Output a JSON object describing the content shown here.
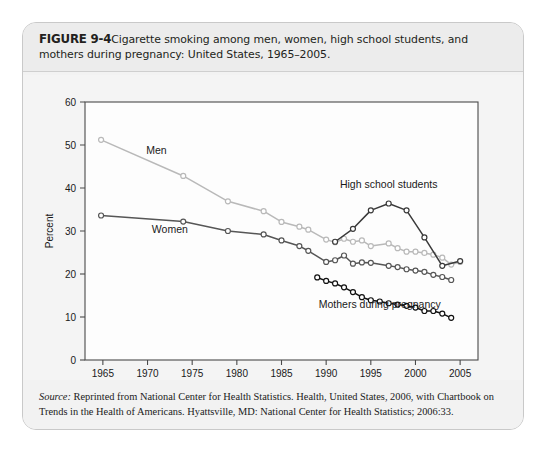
{
  "figure": {
    "number_label": "FIGURE 9-4",
    "caption": "Cigarette smoking among men, women, high school students, and mothers during pregnancy: United States, 1965–2005."
  },
  "source": {
    "label": "Source:",
    "text": " Reprinted from National Center for Health Statistics. Health, United States, 2006, with Chartbook on Trends in the Health of Americans. Hyattsville, MD: National Center for Health Statistics; 2006:33."
  },
  "chart_data": {
    "type": "line",
    "title": "",
    "xlabel": "Year",
    "ylabel": "Percent",
    "xlim": [
      1963,
      2007
    ],
    "ylim": [
      0,
      60
    ],
    "xticks": [
      1965,
      1970,
      1975,
      1980,
      1985,
      1990,
      1995,
      2000,
      2005
    ],
    "yticks": [
      0,
      10,
      20,
      30,
      40,
      50,
      60
    ],
    "grid": false,
    "legend": "inline-annotations",
    "series": [
      {
        "name": "Men",
        "color": "#b9b9b9",
        "marker": "open-circle",
        "label_x": 1971.0,
        "label_y": 48.0,
        "points": [
          [
            1964.8,
            51.2
          ],
          [
            1974.0,
            42.8
          ],
          [
            1979.0,
            36.9
          ],
          [
            1983.0,
            34.6
          ],
          [
            1985.0,
            32.1
          ],
          [
            1987.0,
            31.0
          ],
          [
            1988.0,
            30.3
          ],
          [
            1990.0,
            28.0
          ],
          [
            1991.0,
            27.4
          ],
          [
            1992.0,
            28.2
          ],
          [
            1993.0,
            27.5
          ],
          [
            1994.0,
            27.8
          ],
          [
            1995.0,
            26.5
          ],
          [
            1997.0,
            27.1
          ],
          [
            1998.0,
            26.0
          ],
          [
            1999.0,
            25.2
          ],
          [
            2000.0,
            25.2
          ],
          [
            2001.0,
            24.9
          ],
          [
            2002.0,
            24.5
          ],
          [
            2003.0,
            23.8
          ],
          [
            2004.0,
            22.2
          ],
          [
            2005.0,
            22.8
          ]
        ]
      },
      {
        "name": "Women",
        "color": "#565656",
        "marker": "open-circle",
        "label_x": 1972.5,
        "label_y": 29.6,
        "points": [
          [
            1964.8,
            33.6
          ],
          [
            1974.0,
            32.2
          ],
          [
            1979.0,
            30.0
          ],
          [
            1983.0,
            29.2
          ],
          [
            1985.0,
            27.8
          ],
          [
            1987.0,
            26.5
          ],
          [
            1988.0,
            25.4
          ],
          [
            1990.0,
            22.8
          ],
          [
            1991.0,
            23.2
          ],
          [
            1992.0,
            24.3
          ],
          [
            1993.0,
            22.4
          ],
          [
            1994.0,
            22.7
          ],
          [
            1995.0,
            22.6
          ],
          [
            1997.0,
            21.9
          ],
          [
            1998.0,
            21.6
          ],
          [
            1999.0,
            21.1
          ],
          [
            2000.0,
            20.8
          ],
          [
            2001.0,
            20.5
          ],
          [
            2002.0,
            19.8
          ],
          [
            2003.0,
            19.3
          ],
          [
            2004.0,
            18.6
          ]
        ]
      },
      {
        "name": "High school students",
        "color": "#3a3a3a",
        "marker": "open-circle",
        "label_x": 1997.0,
        "label_y": 40.0,
        "points": [
          [
            1991.0,
            27.5
          ],
          [
            1993.0,
            30.5
          ],
          [
            1995.0,
            34.8
          ],
          [
            1997.0,
            36.4
          ],
          [
            1999.0,
            34.8
          ],
          [
            2001.0,
            28.5
          ],
          [
            2003.0,
            21.9
          ],
          [
            2005.0,
            23.0
          ]
        ]
      },
      {
        "name": "Mothers during pregnancy",
        "color": "#111111",
        "marker": "open-circle",
        "label_x": 1996.0,
        "label_y": 12.0,
        "points": [
          [
            1989.0,
            19.2
          ],
          [
            1990.0,
            18.4
          ],
          [
            1991.0,
            17.8
          ],
          [
            1992.0,
            16.9
          ],
          [
            1993.0,
            15.8
          ],
          [
            1994.0,
            14.6
          ],
          [
            1995.0,
            13.9
          ],
          [
            1996.0,
            13.6
          ],
          [
            1997.0,
            13.2
          ],
          [
            1998.0,
            12.9
          ],
          [
            1999.0,
            12.6
          ],
          [
            2000.0,
            12.2
          ],
          [
            2001.0,
            11.4
          ],
          [
            2002.0,
            11.4
          ],
          [
            2003.0,
            10.8
          ],
          [
            2004.0,
            9.8
          ]
        ]
      }
    ]
  }
}
